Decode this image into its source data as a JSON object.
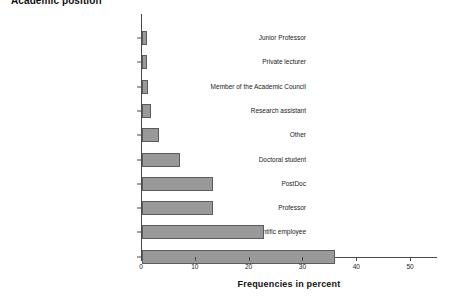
{
  "chart_data": {
    "type": "bar",
    "orientation": "horizontal",
    "title": "Academic position",
    "xlabel": "Frequencies in percent",
    "ylabel": "",
    "xlim": [
      0,
      55
    ],
    "xticks": [
      0,
      10,
      20,
      30,
      40,
      50
    ],
    "grid": false,
    "legend": null,
    "bar_color": "#999999",
    "bar_border_color": "#5c5c5c",
    "categories": [
      "Junior Professor",
      "Private lecturer",
      "Member of the Academic Council",
      "Research assistant",
      "Other",
      "Doctoral student",
      "PostDoc",
      "Professor",
      "Doctoral student and scientific employee",
      "Scientific staff"
    ],
    "values": [
      0.9,
      1.0,
      1.1,
      1.6,
      3.1,
      7.1,
      13.1,
      13.1,
      22.6,
      35.8
    ]
  }
}
